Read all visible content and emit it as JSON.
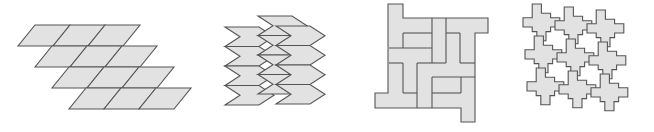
{
  "colors": {
    "fill": "#e2e2e2",
    "stroke": "#555555",
    "background": "#ffffff"
  },
  "figures": [
    {
      "id": "parallelogram-tessellation",
      "shape": "parallelogram",
      "rows": 4,
      "cols": 3,
      "cell_width": 35,
      "cell_height": 21,
      "slant": 17,
      "row_shift": 17,
      "origin": [
        35,
        25
      ]
    },
    {
      "id": "chevron-tessellation",
      "shape": "chevron-hexagon",
      "columns": 3,
      "tiles_per_column": 4,
      "tile_width": 49,
      "tile_height": 19.5,
      "point_depth": 15,
      "column_origins": [
        [
          225,
          27
        ],
        [
          258,
          16
        ],
        [
          276,
          26
        ]
      ]
    },
    {
      "id": "pinwheel-polyomino-tessellation",
      "shape": "rectilinear-pinwheel",
      "outline": [
        [
          388,
          4
        ],
        [
          403,
          4
        ],
        [
          403,
          18
        ],
        [
          488,
          18
        ],
        [
          488,
          33
        ],
        [
          475,
          33
        ],
        [
          475,
          122
        ],
        [
          461,
          122
        ],
        [
          461,
          108
        ],
        [
          375,
          108
        ],
        [
          375,
          93
        ],
        [
          388,
          93
        ]
      ],
      "segments": [
        [
          [
            403,
            33
          ],
          [
            432,
            33
          ]
        ],
        [
          [
            403,
            33
          ],
          [
            403,
            48
          ]
        ],
        [
          [
            432,
            18
          ],
          [
            432,
            63
          ]
        ],
        [
          [
            446,
            18
          ],
          [
            446,
            33
          ]
        ],
        [
          [
            446,
            33
          ],
          [
            460,
            33
          ]
        ],
        [
          [
            460,
            33
          ],
          [
            460,
            63
          ]
        ],
        [
          [
            460,
            63
          ],
          [
            475,
            63
          ]
        ],
        [
          [
            446,
            33
          ],
          [
            446,
            63
          ]
        ],
        [
          [
            389,
            48
          ],
          [
            432,
            48
          ]
        ],
        [
          [
            389,
            63
          ],
          [
            403,
            63
          ]
        ],
        [
          [
            403,
            63
          ],
          [
            403,
            93
          ]
        ],
        [
          [
            403,
            93
          ],
          [
            417,
            93
          ]
        ],
        [
          [
            417,
            63
          ],
          [
            446,
            63
          ]
        ],
        [
          [
            417,
            63
          ],
          [
            417,
            108
          ]
        ],
        [
          [
            432,
            77
          ],
          [
            475,
            77
          ]
        ],
        [
          [
            432,
            77
          ],
          [
            432,
            93
          ]
        ],
        [
          [
            432,
            93
          ],
          [
            461,
            93
          ]
        ],
        [
          [
            461,
            93
          ],
          [
            461,
            77
          ]
        ],
        [
          [
            432,
            93
          ],
          [
            432,
            108
          ]
        ]
      ]
    },
    {
      "id": "cross-tessellation",
      "shape": "interlocking-cross",
      "rows": 3,
      "cols": 3,
      "period": 32,
      "origin": [
        523,
        4
      ]
    }
  ]
}
